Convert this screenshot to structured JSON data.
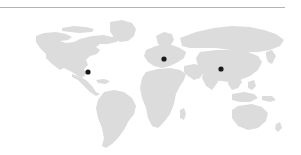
{
  "figure": {
    "width": 301,
    "height": 155,
    "background_color": "#ffffff"
  },
  "divider": {
    "name": "top-horizontal-rule",
    "color": "#b4b4b4",
    "x": 0,
    "y": 7,
    "width": 285,
    "thickness": 1
  },
  "map": {
    "projection": "equirectangular",
    "land_color": "#dcdcdc",
    "ocean_color": "#ffffff",
    "bounds": {
      "left": 40,
      "top": 18,
      "right": 285,
      "bottom": 148
    }
  },
  "chart_data": {
    "type": "scatter",
    "xlabel": "",
    "ylabel": "",
    "marker_color": "#1a1a1a",
    "marker_radius": 2.6,
    "points": [
      {
        "label": "North America",
        "x": 88,
        "y": 72,
        "lon": -99,
        "lat": 33
      },
      {
        "label": "Europe",
        "x": 164,
        "y": 59,
        "lon": 8,
        "lat": 50
      },
      {
        "label": "Asia",
        "x": 221,
        "y": 69,
        "lon": 93,
        "lat": 37
      }
    ],
    "count": 3
  }
}
